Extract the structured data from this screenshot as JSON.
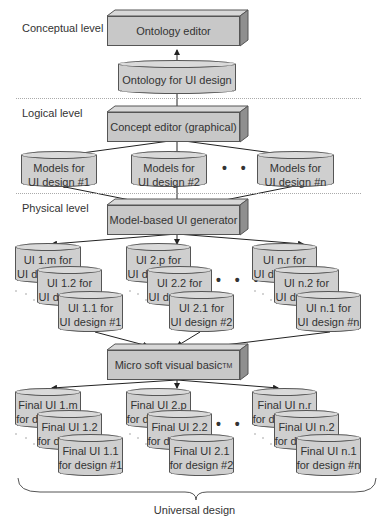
{
  "levels": {
    "conceptual": "Conceptual level",
    "logical": "Logical level",
    "physical": "Physical level"
  },
  "boxes": {
    "ontology_editor": "Ontology editor",
    "concept_editor": "Concept editor (graphical)",
    "ui_generator": "Model-based UI generator",
    "vb": "Micro soft visual basic",
    "vb_sup": "TM"
  },
  "ontology_store": "Ontology for UI design",
  "models": [
    {
      "line1": "Models for",
      "line2": "UI design #1"
    },
    {
      "line1": "Models for",
      "line2": "UI design #2"
    },
    {
      "line1": "Models for",
      "line2": "UI design #n"
    }
  ],
  "ui_groups": [
    [
      {
        "line1": "UI 1.m for",
        "line2": "UI design #1"
      },
      {
        "line1": "UI 1.2 for",
        "line2": "UI design #1"
      },
      {
        "line1": "UI 1.1 for",
        "line2": "UI design #1"
      }
    ],
    [
      {
        "line1": "UI 2.p for",
        "line2": "UI design #2"
      },
      {
        "line1": "UI 2.2 for",
        "line2": "UI design #2"
      },
      {
        "line1": "UI 2.1 for",
        "line2": "UI design #2"
      }
    ],
    [
      {
        "line1": "UI n.r for",
        "line2": "UI design #n"
      },
      {
        "line1": "UI n.2 for",
        "line2": "UI design #n"
      },
      {
        "line1": "UI n.1 for",
        "line2": "UI design #n"
      }
    ]
  ],
  "final_groups": [
    [
      {
        "line1": "Final UI 1.m",
        "line2": "for design #1"
      },
      {
        "line1": "Final UI 1.2",
        "line2": "for design #1"
      },
      {
        "line1": "Final UI 1.1",
        "line2": "for design #1"
      }
    ],
    [
      {
        "line1": "Final UI 2.p",
        "line2": "for design #2"
      },
      {
        "line1": "Final UI 2.2",
        "line2": "for design #2"
      },
      {
        "line1": "Final UI 2.1",
        "line2": "for design #2"
      }
    ],
    [
      {
        "line1": "Final UI n.r",
        "line2": "for design #n"
      },
      {
        "line1": "Final UI n.2",
        "line2": "for design #n"
      },
      {
        "line1": "Final UI n.1",
        "line2": "for design #n"
      }
    ]
  ],
  "ellipsis": "• • •",
  "caption": "Universal design",
  "colors": {
    "box_fill": "#c8c8c8",
    "cylinder_fill": "#cfcfcf",
    "stroke": "#555555"
  }
}
